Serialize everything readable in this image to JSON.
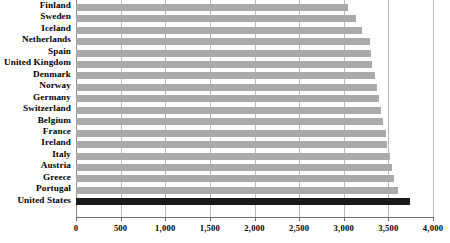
{
  "chart_data": {
    "type": "bar",
    "orientation": "horizontal",
    "title": "",
    "subtitle": "",
    "xlabel": "",
    "ylabel": "",
    "xlim": [
      0,
      4000
    ],
    "ylim": null,
    "grid": true,
    "legend": null,
    "xticks": [
      0,
      500,
      1000,
      1500,
      2000,
      2500,
      3000,
      3500,
      4000
    ],
    "xticklabels": [
      "0",
      "500",
      "1,000",
      "1,500",
      "2,000",
      "2,500",
      "3,000",
      "3,500",
      "4,000"
    ],
    "categories": [
      "Finland",
      "Sweden",
      "Iceland",
      "Netherlands",
      "Spain",
      "United Kingdom",
      "Denmark",
      "Norway",
      "Germany",
      "Switzerland",
      "Belgium",
      "France",
      "Ireland",
      "Italy",
      "Austria",
      "Greece",
      "Portugal",
      "United States"
    ],
    "values": [
      3050,
      3140,
      3210,
      3290,
      3300,
      3320,
      3350,
      3370,
      3400,
      3420,
      3440,
      3470,
      3490,
      3520,
      3540,
      3560,
      3610,
      3740
    ],
    "bar_colors": [
      "#aaaaaa",
      "#aaaaaa",
      "#aaaaaa",
      "#aaaaaa",
      "#aaaaaa",
      "#aaaaaa",
      "#aaaaaa",
      "#aaaaaa",
      "#aaaaaa",
      "#aaaaaa",
      "#aaaaaa",
      "#aaaaaa",
      "#aaaaaa",
      "#aaaaaa",
      "#aaaaaa",
      "#aaaaaa",
      "#aaaaaa",
      "#1a1a1a"
    ],
    "highlight_category": "United States",
    "colors": {
      "bar_default": "#aaaaaa",
      "bar_highlight": "#1a1a1a",
      "gridline": "#b9b9b9",
      "axis": "#6e6e6e",
      "background": "#ffffff",
      "text": "#000000"
    }
  }
}
